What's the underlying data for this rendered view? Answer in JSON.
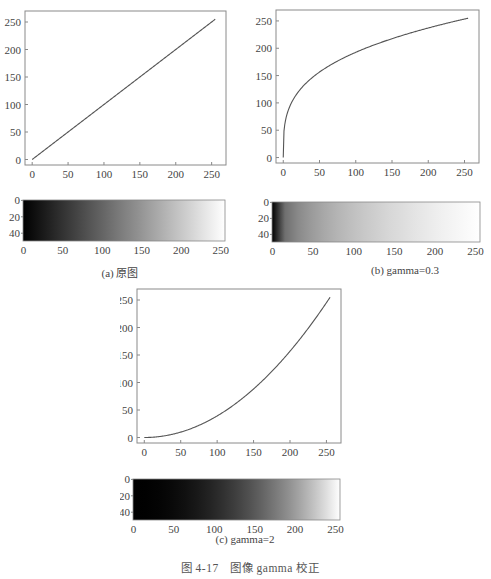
{
  "panels": [
    {
      "id": "a",
      "caption": "(a) 原图",
      "gamma": 1,
      "curve": {
        "x_ticks": [
          "0",
          "50",
          "100",
          "150",
          "200",
          "250"
        ],
        "y_ticks": [
          "0",
          "50",
          "100",
          "150",
          "200",
          "250"
        ]
      },
      "bar": {
        "x_ticks": [
          "0",
          "50",
          "100",
          "150",
          "200",
          "250"
        ],
        "y_ticks": [
          "0",
          "20",
          "40"
        ]
      }
    },
    {
      "id": "b",
      "caption": "(b) gamma=0.3",
      "gamma": 0.3,
      "curve": {
        "x_ticks": [
          "0",
          "50",
          "100",
          "150",
          "200",
          "250"
        ],
        "y_ticks": [
          "0",
          "50",
          "100",
          "150",
          "200",
          "250"
        ]
      },
      "bar": {
        "x_ticks": [
          "0",
          "50",
          "100",
          "150",
          "200",
          "250"
        ],
        "y_ticks": [
          "0",
          "20",
          "40"
        ]
      }
    },
    {
      "id": "c",
      "caption": "(c) gamma=2",
      "gamma": 2,
      "curve": {
        "x_ticks": [
          "0",
          "50",
          "100",
          "150",
          "200",
          "250"
        ],
        "y_ticks": [
          "0",
          "50",
          "100",
          "150",
          "200",
          "250"
        ]
      },
      "bar": {
        "x_ticks": [
          "0",
          "50",
          "100",
          "150",
          "200",
          "250"
        ],
        "y_ticks": [
          "0",
          "20",
          "40"
        ]
      }
    }
  ],
  "figure_caption": "图 4-17　图像 gamma 校正",
  "chart_data": [
    {
      "type": "line",
      "title": "(a) 原图",
      "x": [
        0,
        50,
        100,
        150,
        200,
        255
      ],
      "series": [
        {
          "name": "gamma=1",
          "values": [
            0,
            50,
            100,
            150,
            200,
            255
          ]
        }
      ],
      "xlabel": "",
      "ylabel": "",
      "xlim": [
        -10,
        270
      ],
      "ylim": [
        -10,
        270
      ],
      "x_ticks": [
        0,
        50,
        100,
        150,
        200,
        250
      ],
      "y_ticks": [
        0,
        50,
        100,
        150,
        200,
        250
      ],
      "grid": false
    },
    {
      "type": "heatmap",
      "title": "(a) 原图 gradient",
      "description": "horizontal grayscale ramp 0→255, 256×50 px",
      "x_ticks": [
        0,
        50,
        100,
        150,
        200,
        250
      ],
      "y_ticks": [
        0,
        20,
        40
      ]
    },
    {
      "type": "line",
      "title": "(b) gamma=0.3",
      "x": [
        0,
        5,
        25,
        50,
        100,
        150,
        200,
        255
      ],
      "series": [
        {
          "name": "gamma=0.3",
          "values": [
            0,
            78,
            127,
            157,
            193,
            217,
            237,
            255
          ]
        }
      ],
      "xlabel": "",
      "ylabel": "",
      "xlim": [
        -10,
        270
      ],
      "ylim": [
        -10,
        270
      ],
      "x_ticks": [
        0,
        50,
        100,
        150,
        200,
        250
      ],
      "y_ticks": [
        0,
        50,
        100,
        150,
        200,
        250
      ],
      "grid": false
    },
    {
      "type": "heatmap",
      "title": "(b) gamma=0.3 gradient",
      "description": "grayscale ramp 255*(x/255)^0.3, 256×50 px",
      "x_ticks": [
        0,
        50,
        100,
        150,
        200,
        250
      ],
      "y_ticks": [
        0,
        20,
        40
      ]
    },
    {
      "type": "line",
      "title": "(c) gamma=2",
      "x": [
        0,
        50,
        100,
        150,
        200,
        255
      ],
      "series": [
        {
          "name": "gamma=2",
          "values": [
            0,
            10,
            39,
            88,
            157,
            255
          ]
        }
      ],
      "xlabel": "",
      "ylabel": "",
      "xlim": [
        -10,
        270
      ],
      "ylim": [
        -10,
        270
      ],
      "x_ticks": [
        0,
        50,
        100,
        150,
        200,
        250
      ],
      "y_ticks": [
        0,
        50,
        100,
        150,
        200,
        250
      ],
      "grid": false
    },
    {
      "type": "heatmap",
      "title": "(c) gamma=2 gradient",
      "description": "grayscale ramp 255*(x/255)^2, 256×50 px",
      "x_ticks": [
        0,
        50,
        100,
        150,
        200,
        250
      ],
      "y_ticks": [
        0,
        20,
        40
      ]
    }
  ]
}
